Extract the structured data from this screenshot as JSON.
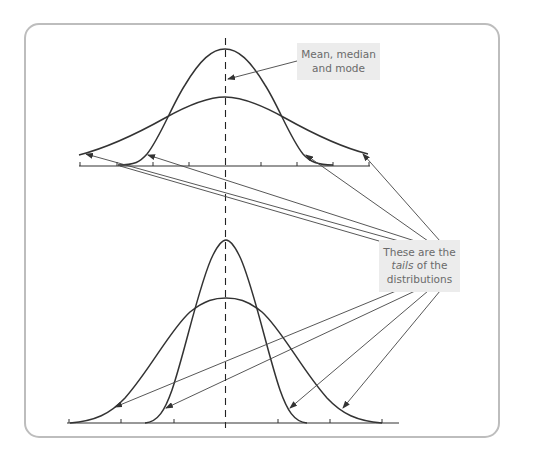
{
  "figure": {
    "type": "normal-distribution-comparison",
    "frame": {
      "stroke": "#bdbdbd",
      "radius": 14
    },
    "curve_color": "#333333",
    "arrow_color": "#444444",
    "label_bg": "#ececec",
    "label_text_color": "#6a6a6a"
  },
  "annotations": {
    "mean": {
      "line1": "Mean, median",
      "line2": "and mode"
    },
    "tails": {
      "line1": "These are the",
      "line2_italic": "tails",
      "line2_rest": " of the",
      "line3": "distributions"
    }
  },
  "panels": [
    {
      "name": "top",
      "description": "Narrow and wide normal curves with the same mean",
      "axis_ticks": 9,
      "curves": [
        "narrow (tall)",
        "wide (flat)"
      ]
    },
    {
      "name": "bottom",
      "description": "Narrow and wide normal curves with the same mean",
      "axis_ticks": 7,
      "curves": [
        "narrow (tall)",
        "wide (flat)"
      ]
    }
  ]
}
